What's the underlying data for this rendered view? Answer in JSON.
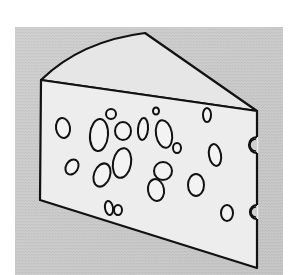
{
  "image": {
    "subject": "Swiss cheese wedge line drawing",
    "colors": {
      "page_background": "#ffffff",
      "backdrop": "#d6d6d6",
      "backdrop_dark": "#bdbdbd",
      "cheese_fill": "#ededed",
      "cheese_top_fill": "#e6e6e6",
      "outline": "#111111"
    },
    "backdrop_rect": {
      "x": 15,
      "y": 27,
      "width": 268,
      "height": 248
    },
    "cheese": {
      "front_face": [
        [
          41,
          80
        ],
        [
          257,
          111
        ],
        [
          257,
          268
        ],
        [
          40,
          200
        ]
      ],
      "top_face_peak": [
        145,
        33
      ],
      "right_corner": [
        257,
        111
      ]
    },
    "holes": [
      {
        "cx": 63,
        "cy": 128,
        "rx": 7,
        "ry": 10,
        "rot": -8
      },
      {
        "cx": 99,
        "cy": 135,
        "rx": 9,
        "ry": 16,
        "rot": 5
      },
      {
        "cx": 111,
        "cy": 114,
        "rx": 5,
        "ry": 5,
        "rot": 0
      },
      {
        "cx": 123,
        "cy": 131,
        "rx": 8,
        "ry": 9,
        "rot": 0
      },
      {
        "cx": 122,
        "cy": 163,
        "rx": 9,
        "ry": 15,
        "rot": 10
      },
      {
        "cx": 72,
        "cy": 167,
        "rx": 6,
        "ry": 8,
        "rot": 30
      },
      {
        "cx": 102,
        "cy": 175,
        "rx": 8,
        "ry": 12,
        "rot": 20
      },
      {
        "cx": 143,
        "cy": 129,
        "rx": 5,
        "ry": 11,
        "rot": 5
      },
      {
        "cx": 156,
        "cy": 111,
        "rx": 3,
        "ry": 3.5,
        "rot": 0
      },
      {
        "cx": 164,
        "cy": 134,
        "rx": 8,
        "ry": 14,
        "rot": -10
      },
      {
        "cx": 177,
        "cy": 148,
        "rx": 4,
        "ry": 5,
        "rot": 0
      },
      {
        "cx": 163,
        "cy": 171,
        "rx": 9,
        "ry": 9,
        "rot": 0
      },
      {
        "cx": 156,
        "cy": 190,
        "rx": 8,
        "ry": 11,
        "rot": -10
      },
      {
        "cx": 207,
        "cy": 115,
        "rx": 4,
        "ry": 7,
        "rot": 0
      },
      {
        "cx": 215,
        "cy": 155,
        "rx": 6,
        "ry": 11,
        "rot": -10
      },
      {
        "cx": 196,
        "cy": 185,
        "rx": 8,
        "ry": 11,
        "rot": 0
      },
      {
        "cx": 109,
        "cy": 208,
        "rx": 4,
        "ry": 7,
        "rot": -10
      },
      {
        "cx": 118,
        "cy": 210,
        "rx": 4,
        "ry": 5,
        "rot": 0
      },
      {
        "cx": 227,
        "cy": 213,
        "rx": 6,
        "ry": 8,
        "rot": 0
      }
    ],
    "edge_notches": [
      {
        "cx": 257,
        "cy": 145,
        "r": 8
      },
      {
        "cx": 257,
        "cy": 212,
        "r": 7
      }
    ]
  }
}
